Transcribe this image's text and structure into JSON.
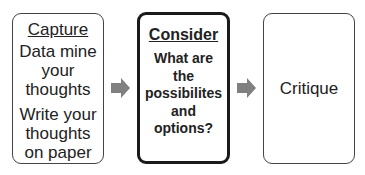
{
  "diagram": {
    "type": "process-flow",
    "steps": [
      {
        "title": "Capture",
        "groups": [
          [
            "Data mine",
            "your",
            "thoughts"
          ],
          [
            "Write your",
            "thoughts",
            "on paper"
          ]
        ]
      },
      {
        "title": "Consider",
        "lines": [
          "What are",
          "the",
          "possibilites",
          "and",
          "options?"
        ],
        "highlighted": true
      },
      {
        "title": "Critique"
      }
    ],
    "arrows": [
      {
        "from": "Capture",
        "to": "Consider"
      },
      {
        "from": "Consider",
        "to": "Critique"
      }
    ],
    "colors": {
      "arrow": "#808080",
      "border": "#444444",
      "highlight_border": "#1a1a1a"
    }
  }
}
